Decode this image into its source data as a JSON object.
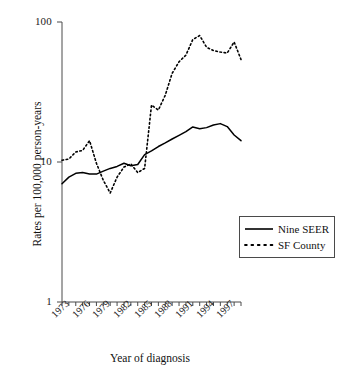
{
  "chart_data": {
    "type": "line",
    "title": "",
    "xlabel": "Year of diagnosis",
    "ylabel": "Rates per 100,000 person-years",
    "yscale": "log",
    "ylim": [
      1,
      100
    ],
    "ytick_labels": [
      "100",
      "10",
      "1"
    ],
    "ytick_values": [
      100,
      10,
      1
    ],
    "xlim": [
      1973,
      1999
    ],
    "xtick_labels": [
      "1973",
      "1976",
      "1979",
      "1982",
      "1985",
      "1988",
      "1991",
      "1994",
      "1997"
    ],
    "xtick_values": [
      1973,
      1976,
      1979,
      1982,
      1985,
      1988,
      1991,
      1994,
      1997
    ],
    "minor_xticks": true,
    "grid": false,
    "legend_position": "right-middle",
    "x": [
      1973,
      1974,
      1975,
      1976,
      1977,
      1978,
      1979,
      1980,
      1981,
      1982,
      1983,
      1984,
      1985,
      1986,
      1987,
      1988,
      1989,
      1990,
      1991,
      1992,
      1993,
      1994,
      1995,
      1996,
      1997,
      1998,
      1999
    ],
    "series": [
      {
        "name": "Nine SEER",
        "style": "solid",
        "color": "#000000",
        "values": [
          7.0,
          7.8,
          8.3,
          8.4,
          8.2,
          8.2,
          8.6,
          9.0,
          9.3,
          9.8,
          9.4,
          9.6,
          11.3,
          12.0,
          12.9,
          13.7,
          14.6,
          15.5,
          16.5,
          17.8,
          17.3,
          17.6,
          18.4,
          18.8,
          17.9,
          15.6,
          14.2
        ]
      },
      {
        "name": "SF County",
        "style": "dotted",
        "color": "#000000",
        "values": [
          10.3,
          10.5,
          11.8,
          12.1,
          14.2,
          9.8,
          7.4,
          6.0,
          7.8,
          9.2,
          9.7,
          8.4,
          9.0,
          25.5,
          23.5,
          30.0,
          43.0,
          52.0,
          58.0,
          75.0,
          80.0,
          66.0,
          62.5,
          61.0,
          60.0,
          72.0,
          54.0
        ]
      }
    ]
  },
  "legend": {
    "entries": [
      {
        "label": "Nine SEER",
        "style": "solid"
      },
      {
        "label": "SF County",
        "style": "dotted"
      }
    ]
  }
}
